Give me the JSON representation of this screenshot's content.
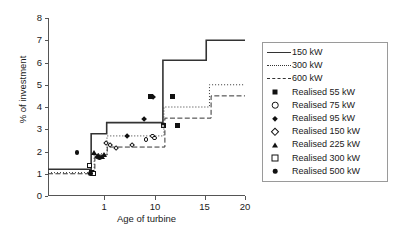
{
  "chart_data": {
    "type": "line",
    "title": "",
    "xlabel": "Age of turbine",
    "ylabel": "% of investment",
    "xlim": [
      0,
      20
    ],
    "ylim": [
      0,
      8
    ],
    "xscale": "log-like",
    "grid": false,
    "legend_position": "right",
    "yticks": [
      0,
      1,
      2,
      3,
      4,
      5,
      6,
      7,
      8
    ],
    "xticks": [
      1,
      10,
      15,
      20
    ],
    "series": [
      {
        "name": "150 kW",
        "style": "solid",
        "type": "step",
        "points": [
          {
            "x": 0.0,
            "y": 1.2
          },
          {
            "x": 0.62,
            "y": 1.2
          },
          {
            "x": 0.62,
            "y": 2.8
          },
          {
            "x": 1.45,
            "y": 2.8
          },
          {
            "x": 1.45,
            "y": 3.3
          },
          {
            "x": 10.8,
            "y": 3.3
          },
          {
            "x": 10.8,
            "y": 6.1
          },
          {
            "x": 15.2,
            "y": 6.1
          },
          {
            "x": 15.2,
            "y": 7.0
          },
          {
            "x": 20.0,
            "y": 7.0
          }
        ]
      },
      {
        "name": "300 kW",
        "style": "dotted",
        "type": "step",
        "points": [
          {
            "x": 0.0,
            "y": 1.05
          },
          {
            "x": 0.7,
            "y": 1.05
          },
          {
            "x": 0.7,
            "y": 1.9
          },
          {
            "x": 1.5,
            "y": 1.9
          },
          {
            "x": 1.5,
            "y": 2.7
          },
          {
            "x": 10.9,
            "y": 2.7
          },
          {
            "x": 10.9,
            "y": 4.0
          },
          {
            "x": 15.6,
            "y": 4.0
          },
          {
            "x": 15.6,
            "y": 5.0
          },
          {
            "x": 20.0,
            "y": 5.0
          }
        ]
      },
      {
        "name": "600 kW",
        "style": "dashed",
        "type": "step",
        "points": [
          {
            "x": 0.0,
            "y": 1.0
          },
          {
            "x": 0.72,
            "y": 1.0
          },
          {
            "x": 0.72,
            "y": 1.85
          },
          {
            "x": 1.55,
            "y": 1.85
          },
          {
            "x": 1.55,
            "y": 2.2
          },
          {
            "x": 11.0,
            "y": 2.2
          },
          {
            "x": 11.0,
            "y": 3.5
          },
          {
            "x": 15.8,
            "y": 3.5
          },
          {
            "x": 15.8,
            "y": 4.5
          },
          {
            "x": 20.0,
            "y": 4.5
          }
        ]
      }
    ],
    "scatter_series": [
      {
        "name": "Realised 55 kW",
        "marker": "filled-square",
        "points": [
          {
            "x": 10.9,
            "y": 3.15
          },
          {
            "x": 11.8,
            "y": 4.45
          },
          {
            "x": 12.3,
            "y": 3.15
          },
          {
            "x": 9.2,
            "y": 4.45
          }
        ]
      },
      {
        "name": "Realised 75 kW",
        "marker": "open-circle",
        "points": [
          {
            "x": 8.4,
            "y": 2.55
          },
          {
            "x": 9.6,
            "y": 2.7
          },
          {
            "x": 9.9,
            "y": 2.6
          },
          {
            "x": 10.8,
            "y": 3.15
          }
        ]
      },
      {
        "name": "Realised 95 kW",
        "marker": "filled-diamond",
        "points": [
          {
            "x": 5.1,
            "y": 2.7
          },
          {
            "x": 8.0,
            "y": 3.45
          },
          {
            "x": 9.7,
            "y": 4.45
          }
        ]
      },
      {
        "name": "Realised 150 kW",
        "marker": "open-diamond",
        "points": [
          {
            "x": 1.35,
            "y": 2.4
          },
          {
            "x": 2.1,
            "y": 2.3
          },
          {
            "x": 3.2,
            "y": 2.15
          },
          {
            "x": 5.9,
            "y": 2.3
          }
        ]
      },
      {
        "name": "Realised 225 kW",
        "marker": "filled-triangle",
        "points": [
          {
            "x": 0.7,
            "y": 1.95
          },
          {
            "x": 0.82,
            "y": 1.8
          },
          {
            "x": 0.95,
            "y": 1.75
          },
          {
            "x": 1.02,
            "y": 1.85
          }
        ]
      },
      {
        "name": "Realised 300 kW",
        "marker": "open-square",
        "points": [
          {
            "x": 0.58,
            "y": 1.35
          },
          {
            "x": 0.62,
            "y": 1.05
          },
          {
            "x": 0.68,
            "y": 1.02
          }
        ]
      },
      {
        "name": "Realised 500 kW",
        "marker": "filled-circle",
        "points": [
          {
            "x": 0.3,
            "y": 1.95
          },
          {
            "x": 0.6,
            "y": 1.0
          },
          {
            "x": 0.78,
            "y": 1.75
          },
          {
            "x": 0.86,
            "y": 1.72
          }
        ]
      }
    ]
  },
  "legend": {
    "items": [
      {
        "label": "150 kW",
        "key": "line-solid"
      },
      {
        "label": "300 kW",
        "key": "line-dotted"
      },
      {
        "label": "600 kW",
        "key": "line-dashed"
      },
      {
        "label": "Realised 55 kW",
        "key": "filled-square"
      },
      {
        "label": "Realised 75 kW",
        "key": "open-circle"
      },
      {
        "label": "Realised 95 kW",
        "key": "filled-diamond"
      },
      {
        "label": "Realised 150 kW",
        "key": "open-diamond"
      },
      {
        "label": "Realised 225 kW",
        "key": "filled-triangle"
      },
      {
        "label": "Realised 300 kW",
        "key": "open-square"
      },
      {
        "label": "Realised 500 kW",
        "key": "filled-circle"
      }
    ]
  },
  "colors": {
    "line": "#333333",
    "marker": "#111111",
    "axis": "#555555",
    "background": "#ffffff"
  }
}
